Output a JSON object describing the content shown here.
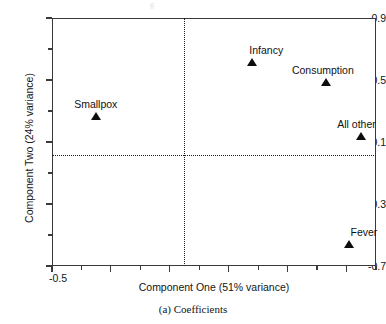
{
  "figure": {
    "caption": "(a) Coefficients",
    "bleed_text": "g"
  },
  "chart_data": {
    "type": "scatter",
    "title": "",
    "xlabel": "Component One (51% variance)",
    "ylabel": "Component Two (24% variance)",
    "xlim": [
      -0.5,
      0.6
    ],
    "ylim": [
      -0.7,
      0.9
    ],
    "grid": false,
    "legend": "none",
    "reference_lines": {
      "x": 0,
      "y": 0,
      "style": "dotted"
    },
    "x_ticks": [
      {
        "value": -0.5,
        "label": "-0.5",
        "major": true
      },
      {
        "value": -0.4,
        "label": "",
        "major": false
      },
      {
        "value": -0.3,
        "label": "",
        "major": true
      },
      {
        "value": -0.2,
        "label": "",
        "major": false
      },
      {
        "value": -0.1,
        "label": "",
        "major": true
      },
      {
        "value": 0.0,
        "label": "",
        "major": false
      },
      {
        "value": 0.1,
        "label": "",
        "major": true
      },
      {
        "value": 0.2,
        "label": "",
        "major": false
      },
      {
        "value": 0.3,
        "label": "",
        "major": true
      },
      {
        "value": 0.4,
        "label": "",
        "major": false
      },
      {
        "value": 0.5,
        "label": "",
        "major": true
      },
      {
        "value": 0.6,
        "label": "",
        "major": false
      }
    ],
    "y_ticks": [
      {
        "value": 0.9,
        "label": "0.9",
        "major": true
      },
      {
        "value": 0.7,
        "label": "",
        "major": false
      },
      {
        "value": 0.5,
        "label": "0.5",
        "major": true
      },
      {
        "value": 0.3,
        "label": "",
        "major": false
      },
      {
        "value": 0.1,
        "label": "0.1",
        "major": true
      },
      {
        "value": -0.1,
        "label": "",
        "major": false
      },
      {
        "value": -0.3,
        "label": "-0.3",
        "major": true
      },
      {
        "value": -0.5,
        "label": "",
        "major": false
      },
      {
        "value": -0.7,
        "label": "-0.7",
        "major": true
      }
    ],
    "marker": {
      "shape": "triangle",
      "color": "#0d0d0d",
      "size": 9
    },
    "points": [
      {
        "label": "Infancy",
        "x": 0.18,
        "y": 0.6,
        "label_dx": -3,
        "label_dy": -20
      },
      {
        "label": "Consumption",
        "x": 0.43,
        "y": 0.47,
        "label_dx": -34,
        "label_dy": -20
      },
      {
        "label": "Smallpox",
        "x": -0.35,
        "y": 0.25,
        "label_dx": -22,
        "label_dy": -20
      },
      {
        "label": "All other",
        "x": 0.55,
        "y": 0.12,
        "label_dx": -24,
        "label_dy": -20
      },
      {
        "label": "Fever",
        "x": 0.51,
        "y": -0.58,
        "label_dx": 1,
        "label_dy": -20
      }
    ]
  }
}
